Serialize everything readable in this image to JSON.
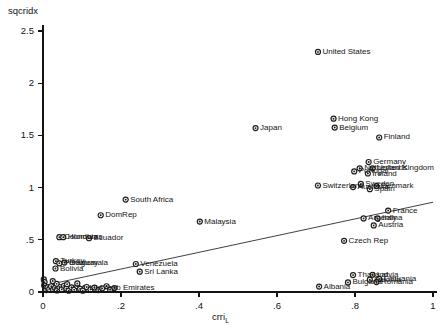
{
  "chart_data": {
    "type": "scatter",
    "title": "",
    "subtitle": "",
    "ylabel": "sqcridx",
    "xlabel": "crri",
    "xlabel_subscript": "L",
    "xlim": [
      0,
      1
    ],
    "ylim": [
      0,
      2.5
    ],
    "xticks": [
      "0",
      ".2",
      ".4",
      ".6",
      ".8",
      "1"
    ],
    "xtick_values": [
      0,
      0.2,
      0.4,
      0.6,
      0.8,
      1.0
    ],
    "yticks": [
      "0",
      ".5",
      "1",
      "1.5",
      "2",
      "2.5"
    ],
    "ytick_values": [
      0,
      0.5,
      1.0,
      1.5,
      2.0,
      2.5
    ],
    "grid": false,
    "legend": "none",
    "marker_style": "circle-with-center-dot",
    "fit_line": {
      "present": true,
      "type": "linear",
      "x_start": 0.0,
      "y_start": 0.06,
      "x_end": 1.0,
      "y_end": 0.86
    },
    "points": [
      {
        "label": "United States",
        "x": 0.705,
        "y": 2.3,
        "label_pos": "right"
      },
      {
        "label": "Hong Kong",
        "x": 0.745,
        "y": 1.66,
        "label_pos": "right"
      },
      {
        "label": "Belgium",
        "x": 0.748,
        "y": 1.575,
        "label_pos": "right"
      },
      {
        "label": "Japan",
        "x": 0.545,
        "y": 1.57,
        "label_pos": "right"
      },
      {
        "label": "Finland",
        "x": 0.862,
        "y": 1.48,
        "label_pos": "right"
      },
      {
        "label": "Germany",
        "x": 0.835,
        "y": 1.245,
        "label_pos": "right"
      },
      {
        "label": "Netherlands",
        "x": 0.812,
        "y": 1.185,
        "label_pos": "right"
      },
      {
        "label": "United Kingdom",
        "x": 0.845,
        "y": 1.185,
        "label_pos": "right"
      },
      {
        "label": "Portugal",
        "x": 0.798,
        "y": 1.155,
        "label_pos": "right"
      },
      {
        "label": "Ireland",
        "x": 0.833,
        "y": 1.135,
        "label_pos": "right"
      },
      {
        "label": "Denmark",
        "x": 0.855,
        "y": 1.015,
        "label_pos": "right"
      },
      {
        "label": "Sweden",
        "x": 0.815,
        "y": 1.035,
        "label_pos": "right"
      },
      {
        "label": "Australia",
        "x": 0.795,
        "y": 1.005,
        "label_pos": "right"
      },
      {
        "label": "Spain",
        "x": 0.838,
        "y": 0.985,
        "label_pos": "right"
      },
      {
        "label": "Switzerland",
        "x": 0.705,
        "y": 1.02,
        "label_pos": "right"
      },
      {
        "label": "France",
        "x": 0.885,
        "y": 0.78,
        "label_pos": "right"
      },
      {
        "label": "Italy",
        "x": 0.858,
        "y": 0.705,
        "label_pos": "right"
      },
      {
        "label": "Argentina",
        "x": 0.822,
        "y": 0.705,
        "label_pos": "right"
      },
      {
        "label": "Austria",
        "x": 0.848,
        "y": 0.638,
        "label_pos": "right"
      },
      {
        "label": "Czech Rep",
        "x": 0.772,
        "y": 0.49,
        "label_pos": "right"
      },
      {
        "label": "South Africa",
        "x": 0.212,
        "y": 0.885,
        "label_pos": "right"
      },
      {
        "label": "DomRep",
        "x": 0.148,
        "y": 0.735,
        "label_pos": "right"
      },
      {
        "label": "Malaysia",
        "x": 0.402,
        "y": 0.675,
        "label_pos": "right"
      },
      {
        "label": "Colombia",
        "x": 0.042,
        "y": 0.525,
        "label_pos": "right"
      },
      {
        "label": "Honduras",
        "x": 0.052,
        "y": 0.525,
        "label_pos": "right"
      },
      {
        "label": "Ecuador",
        "x": 0.118,
        "y": 0.515,
        "label_pos": "right"
      },
      {
        "label": "Turkey",
        "x": 0.033,
        "y": 0.295,
        "label_pos": "right"
      },
      {
        "label": "Paraguay",
        "x": 0.042,
        "y": 0.275,
        "label_pos": "right"
      },
      {
        "label": "Guatemala",
        "x": 0.055,
        "y": 0.282,
        "label_pos": "right"
      },
      {
        "label": "Bolivia",
        "x": 0.032,
        "y": 0.225,
        "label_pos": "right"
      },
      {
        "label": "Venezuela",
        "x": 0.238,
        "y": 0.268,
        "label_pos": "right"
      },
      {
        "label": "Sri Lanka",
        "x": 0.248,
        "y": 0.195,
        "label_pos": "right"
      },
      {
        "label": "Thailand",
        "x": 0.795,
        "y": 0.162,
        "label_pos": "right"
      },
      {
        "label": "Latvia",
        "x": 0.845,
        "y": 0.165,
        "label_pos": "right"
      },
      {
        "label": "Lithuania",
        "x": 0.862,
        "y": 0.125,
        "label_pos": "right"
      },
      {
        "label": "Estonia",
        "x": 0.838,
        "y": 0.118,
        "label_pos": "right"
      },
      {
        "label": "Romania",
        "x": 0.855,
        "y": 0.095,
        "label_pos": "right"
      },
      {
        "label": "Bulgaria",
        "x": 0.782,
        "y": 0.092,
        "label_pos": "right"
      },
      {
        "label": "Albania",
        "x": 0.708,
        "y": 0.052,
        "label_pos": "right"
      },
      {
        "label": "Utd Arab Emirates",
        "x": 0.108,
        "y": 0.04,
        "label_pos": "right"
      },
      {
        "label": "",
        "x": 0.002,
        "y": 0.12,
        "label_pos": "none"
      },
      {
        "label": "",
        "x": 0.004,
        "y": 0.095,
        "label_pos": "none"
      },
      {
        "label": "",
        "x": 0.003,
        "y": 0.062,
        "label_pos": "none"
      },
      {
        "label": "",
        "x": 0.006,
        "y": 0.035,
        "label_pos": "none"
      },
      {
        "label": "",
        "x": 0.008,
        "y": 0.018,
        "label_pos": "none"
      },
      {
        "label": "",
        "x": 0.012,
        "y": 0.045,
        "label_pos": "none"
      },
      {
        "label": "",
        "x": 0.016,
        "y": 0.028,
        "label_pos": "none"
      },
      {
        "label": "",
        "x": 0.021,
        "y": 0.055,
        "label_pos": "none"
      },
      {
        "label": "",
        "x": 0.026,
        "y": 0.022,
        "label_pos": "none"
      },
      {
        "label": "",
        "x": 0.031,
        "y": 0.04,
        "label_pos": "none"
      },
      {
        "label": "",
        "x": 0.036,
        "y": 0.015,
        "label_pos": "none"
      },
      {
        "label": "",
        "x": 0.042,
        "y": 0.048,
        "label_pos": "none"
      },
      {
        "label": "",
        "x": 0.048,
        "y": 0.025,
        "label_pos": "none"
      },
      {
        "label": "",
        "x": 0.054,
        "y": 0.06,
        "label_pos": "none"
      },
      {
        "label": "",
        "x": 0.06,
        "y": 0.032,
        "label_pos": "none"
      },
      {
        "label": "",
        "x": 0.066,
        "y": 0.012,
        "label_pos": "none"
      },
      {
        "label": "",
        "x": 0.073,
        "y": 0.045,
        "label_pos": "none"
      },
      {
        "label": "",
        "x": 0.08,
        "y": 0.022,
        "label_pos": "none"
      },
      {
        "label": "",
        "x": 0.088,
        "y": 0.055,
        "label_pos": "none"
      },
      {
        "label": "",
        "x": 0.095,
        "y": 0.03,
        "label_pos": "none"
      },
      {
        "label": "",
        "x": 0.102,
        "y": 0.012,
        "label_pos": "none"
      },
      {
        "label": "",
        "x": 0.112,
        "y": 0.048,
        "label_pos": "none"
      },
      {
        "label": "",
        "x": 0.122,
        "y": 0.025,
        "label_pos": "none"
      },
      {
        "label": "",
        "x": 0.132,
        "y": 0.042,
        "label_pos": "none"
      },
      {
        "label": "",
        "x": 0.142,
        "y": 0.018,
        "label_pos": "none"
      },
      {
        "label": "",
        "x": 0.152,
        "y": 0.035,
        "label_pos": "none"
      },
      {
        "label": "",
        "x": 0.163,
        "y": 0.055,
        "label_pos": "none"
      },
      {
        "label": "",
        "x": 0.172,
        "y": 0.022,
        "label_pos": "none"
      },
      {
        "label": "",
        "x": 0.183,
        "y": 0.038,
        "label_pos": "none"
      },
      {
        "label": "",
        "x": 0.035,
        "y": 0.078,
        "label_pos": "none"
      },
      {
        "label": "",
        "x": 0.025,
        "y": 0.105,
        "label_pos": "none"
      },
      {
        "label": "",
        "x": 0.062,
        "y": 0.075,
        "label_pos": "none"
      },
      {
        "label": "",
        "x": 0.088,
        "y": 0.082,
        "label_pos": "none"
      }
    ]
  }
}
